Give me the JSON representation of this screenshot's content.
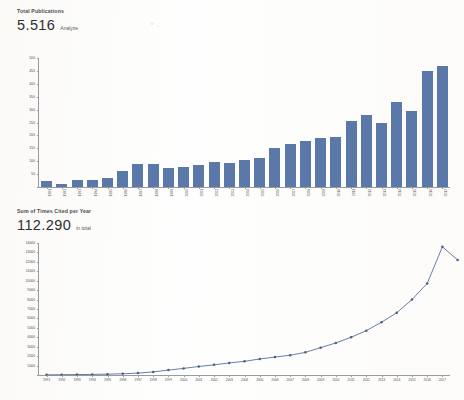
{
  "report": {
    "publications": {
      "label": "Total Publications",
      "value": "5.516",
      "suffix": "Analyze"
    },
    "citations": {
      "label": "Sum of Times Cited per Year",
      "value": "112.290",
      "suffix": "in total"
    }
  },
  "chart_data": [
    {
      "type": "bar",
      "title": "Total Publications",
      "xlabel": "",
      "ylabel": "",
      "ylim": [
        0,
        500
      ],
      "ytick_step": 50,
      "yticks": [
        0,
        50,
        100,
        150,
        200,
        250,
        300,
        350,
        400,
        450,
        500
      ],
      "grid": false,
      "bar_color": "#5b79a8",
      "categories": [
        "1991",
        "1992",
        "1993",
        "1994",
        "1995",
        "1996",
        "1997",
        "1998",
        "1999",
        "2000",
        "2001",
        "2002",
        "2003",
        "2004",
        "2005",
        "2006",
        "2007",
        "2008",
        "2009",
        "2010",
        "2011",
        "2012",
        "2013",
        "2014",
        "2015",
        "2016",
        "2017"
      ],
      "values": [
        22,
        10,
        27,
        28,
        36,
        63,
        88,
        88,
        74,
        77,
        86,
        96,
        93,
        104,
        112,
        150,
        165,
        180,
        190,
        192,
        255,
        280,
        250,
        330,
        295,
        450,
        470
      ]
    },
    {
      "type": "line",
      "title": "Sum of Times Cited per Year",
      "xlabel": "",
      "ylabel": "",
      "ylim": [
        0,
        14000
      ],
      "ytick_step": 1000,
      "yticks": [
        0,
        1000,
        2000,
        3000,
        4000,
        5000,
        6000,
        7000,
        8000,
        9000,
        10000,
        11000,
        12000,
        13000,
        14000
      ],
      "grid": false,
      "line_color": "#5b6f96",
      "marker_color": "#4a5f85",
      "categories": [
        "1991",
        "1992",
        "1993",
        "1994",
        "1995",
        "1996",
        "1997",
        "1998",
        "1999",
        "2000",
        "2001",
        "2002",
        "2003",
        "2004",
        "2005",
        "2006",
        "2007",
        "2008",
        "2009",
        "2010",
        "2011",
        "2012",
        "2013",
        "2014",
        "2015",
        "2016",
        "2017"
      ],
      "values": [
        20,
        30,
        45,
        60,
        90,
        130,
        200,
        330,
        520,
        700,
        900,
        1080,
        1280,
        1450,
        1700,
        1900,
        2100,
        2400,
        2900,
        3400,
        4000,
        4700,
        5600,
        6600,
        8000,
        9700,
        13600,
        12200
      ]
    }
  ]
}
